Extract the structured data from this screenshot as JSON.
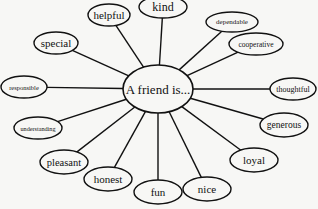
{
  "diagram": {
    "type": "spider-web / concept map",
    "center": {
      "label": "A friend is...",
      "cx": 158,
      "cy": 89,
      "rx": 35,
      "ry": 24,
      "font_size": 13
    },
    "nodes": [
      {
        "label": "kind",
        "cx": 163,
        "cy": 7,
        "rx": 24,
        "ry": 11,
        "font_size": 12
      },
      {
        "label": "helpful",
        "cx": 109,
        "cy": 15,
        "rx": 21,
        "ry": 11,
        "font_size": 11
      },
      {
        "label": "dependable",
        "cx": 232,
        "cy": 22,
        "rx": 26,
        "ry": 10,
        "font_size": 7
      },
      {
        "label": "special",
        "cx": 56,
        "cy": 43,
        "rx": 22,
        "ry": 11,
        "font_size": 11
      },
      {
        "label": "cooperative",
        "cx": 256,
        "cy": 44,
        "rx": 27,
        "ry": 11,
        "font_size": 7.5
      },
      {
        "label": "responsible",
        "cx": 24,
        "cy": 87,
        "rx": 23,
        "ry": 11,
        "font_size": 6.5
      },
      {
        "label": "thoughtful",
        "cx": 293,
        "cy": 89,
        "rx": 23,
        "ry": 11,
        "font_size": 8
      },
      {
        "label": "understanding",
        "cx": 38,
        "cy": 128,
        "rx": 24,
        "ry": 11,
        "font_size": 6.2
      },
      {
        "label": "generous",
        "cx": 284,
        "cy": 125,
        "rx": 24,
        "ry": 12,
        "font_size": 9.5
      },
      {
        "label": "pleasant",
        "cx": 64,
        "cy": 162,
        "rx": 24,
        "ry": 12,
        "font_size": 10.5
      },
      {
        "label": "loyal",
        "cx": 254,
        "cy": 160,
        "rx": 24,
        "ry": 12,
        "font_size": 11
      },
      {
        "label": "honest",
        "cx": 108,
        "cy": 179,
        "rx": 24,
        "ry": 12,
        "font_size": 11
      },
      {
        "label": "fun",
        "cx": 158,
        "cy": 192,
        "rx": 24,
        "ry": 12,
        "font_size": 11
      },
      {
        "label": "nice",
        "cx": 207,
        "cy": 189,
        "rx": 24,
        "ry": 12,
        "font_size": 11
      }
    ],
    "colors": {
      "stroke": "#111111",
      "fill": "#f7f7f5",
      "text": "#111111"
    }
  }
}
